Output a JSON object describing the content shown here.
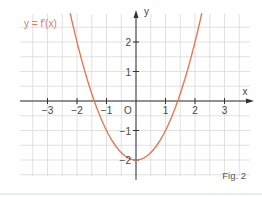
{
  "figure": {
    "caption": "Fig. 2",
    "function_label": "y = f′(x)",
    "x_axis_label": "x",
    "y_axis_label": "y",
    "origin_label": "O"
  },
  "colors": {
    "curve": "#e07a55",
    "grid": "#d9d9d9",
    "axis": "#333333",
    "text": "#444444"
  },
  "chart_data": {
    "type": "line",
    "title": "",
    "xlabel": "x",
    "ylabel": "y",
    "xlim": [
      -3.9,
      3.9
    ],
    "ylim": [
      -2.5,
      2.9
    ],
    "x_ticks": [
      -3,
      -2,
      -1,
      1,
      2,
      3
    ],
    "y_ticks": [
      -2,
      -1,
      1,
      2
    ],
    "grid": true,
    "grid_step": 0.5,
    "legend": "inline label top-left",
    "series": [
      {
        "name": "y = f′(x)",
        "function": "x^2 - 2",
        "x": [
          -2.2,
          -2.0,
          -1.5,
          -1.414,
          -1.0,
          -0.5,
          0.0,
          0.5,
          1.0,
          1.414,
          1.5,
          2.0,
          2.2
        ],
        "values": [
          2.84,
          2.0,
          0.25,
          0.0,
          -1.0,
          -1.75,
          -2.0,
          -1.75,
          -1.0,
          0.0,
          0.25,
          2.0,
          2.84
        ]
      }
    ]
  }
}
